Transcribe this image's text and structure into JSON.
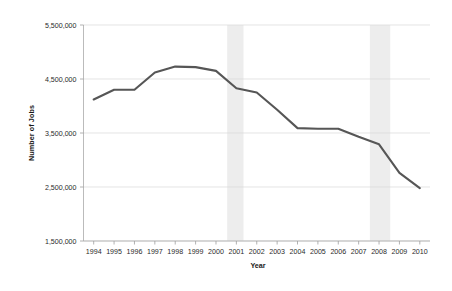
{
  "chart_data": {
    "type": "line",
    "title": "",
    "xlabel": "Year",
    "ylabel": "Number of Jobs",
    "xlim": [
      1993.5,
      2010.5
    ],
    "ylim": [
      1500000,
      5500000
    ],
    "grid": true,
    "legend": "none",
    "x_tick_labels": [
      "1994",
      "1995",
      "1996",
      "1997",
      "1998",
      "1999",
      "2000",
      "2001",
      "2002",
      "2003",
      "2004",
      "2005",
      "2006",
      "2007",
      "2008",
      "2009",
      "2010"
    ],
    "y_tick_labels": [
      "1,500,000",
      "2,500,000",
      "3,500,000",
      "4,500,000",
      "5,500,000"
    ],
    "y_tick_values": [
      1500000,
      2500000,
      3500000,
      4500000,
      5500000
    ],
    "x": [
      1994,
      1995,
      1996,
      1997,
      1998,
      1999,
      2000,
      2001,
      2002,
      2003,
      2004,
      2005,
      2006,
      2007,
      2008,
      2009,
      2010
    ],
    "values": [
      4120000,
      4300000,
      4300000,
      4620000,
      4730000,
      4720000,
      4650000,
      4330000,
      4250000,
      3930000,
      3590000,
      3580000,
      3580000,
      3430000,
      3290000,
      2760000,
      2480000
    ],
    "series": [
      {
        "name": "Number of Jobs",
        "color": "#565656",
        "values": [
          4120000,
          4300000,
          4300000,
          4620000,
          4730000,
          4720000,
          4650000,
          4330000,
          4250000,
          3930000,
          3590000,
          3580000,
          3580000,
          3430000,
          3290000,
          2760000,
          2480000
        ]
      }
    ],
    "annotations": [
      {
        "name": "recession-band-2001",
        "type": "vspan",
        "x_start": 2000.55,
        "x_end": 2001.35,
        "color": "#ededed"
      },
      {
        "name": "recession-band-2008",
        "type": "vspan",
        "x_start": 2007.55,
        "x_end": 2008.55,
        "color": "#ededed"
      }
    ],
    "colors": {
      "line": "#565656",
      "grid": "#d9d9d9",
      "axis": "#b3b3b3",
      "band": "#ededed",
      "background": "#ffffff",
      "text": "#1a1a1a"
    }
  }
}
